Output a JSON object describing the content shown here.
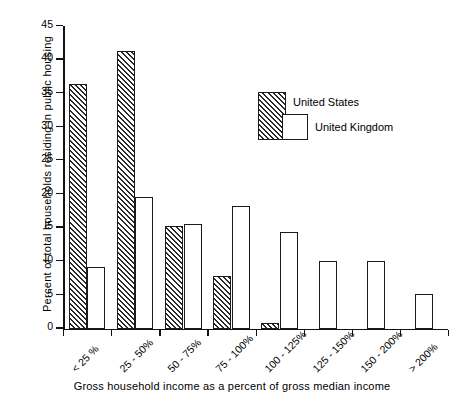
{
  "chart_data": {
    "type": "bar",
    "title": "",
    "xlabel": "Gross household income as a percent of gross median income",
    "ylabel": "Percent of total households residing in public housing",
    "categories": [
      "< 25 %",
      "25 - 50%",
      "50 - 75%",
      "75 - 100%",
      "100 - 125%",
      "125 - 150%",
      "150 - 200%",
      "> 200%"
    ],
    "series": [
      {
        "name": "United States",
        "values": [
          36.4,
          41.3,
          15.2,
          7.8,
          0.8,
          0,
          0,
          0
        ]
      },
      {
        "name": "United Kingdom",
        "values": [
          9.2,
          19.5,
          15.6,
          18.2,
          14.3,
          10.0,
          10.0,
          5.1
        ]
      }
    ],
    "ylim": [
      0,
      45
    ],
    "yticks": [
      0,
      5,
      10,
      15,
      20,
      25,
      30,
      35,
      40,
      45
    ],
    "ytick_labels": [
      "0",
      "5",
      "I0",
      "I5",
      "20",
      "25",
      "30",
      "35",
      "40",
      "45"
    ],
    "grid": false,
    "legend_position": "upper-right"
  },
  "legend": {
    "us_label": "United States",
    "uk_label": "United Kingdom"
  },
  "axes": {
    "y_title": "Percent of total households residing in public housing",
    "x_title": "Gross household income as a percent of gross median income"
  }
}
